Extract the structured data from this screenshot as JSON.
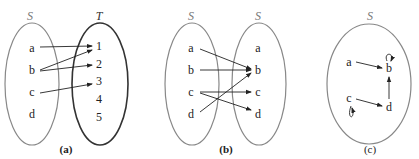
{
  "panels": [
    {
      "caption": "(a)",
      "domain": {
        "name": "S",
        "elements": [
          "a",
          "b",
          "c",
          "d"
        ]
      },
      "codomain": {
        "name": "T",
        "elements": [
          "1",
          "2",
          "3",
          "4",
          "5"
        ]
      },
      "arrows": [
        [
          "a",
          "1"
        ],
        [
          "b",
          "1"
        ],
        [
          "b",
          "2"
        ],
        [
          "c",
          "3"
        ]
      ]
    },
    {
      "caption": "(b)",
      "domain": {
        "name": "S",
        "elements": [
          "a",
          "b",
          "c",
          "d"
        ]
      },
      "codomain": {
        "name": "S",
        "elements": [
          "a",
          "b",
          "c",
          "d"
        ]
      },
      "arrows": [
        [
          "a",
          "b"
        ],
        [
          "b",
          "b"
        ],
        [
          "c",
          "c"
        ],
        [
          "c",
          "d"
        ],
        [
          "d",
          "b"
        ]
      ]
    },
    {
      "caption": "(c)",
      "set": {
        "name": "S",
        "elements": [
          "a",
          "b",
          "c",
          "d"
        ]
      },
      "arrows": [
        [
          "a",
          "b"
        ],
        [
          "b",
          "b"
        ],
        [
          "c",
          "d"
        ],
        [
          "c",
          "c"
        ],
        [
          "d",
          "b"
        ]
      ]
    }
  ],
  "colors": {
    "light_ellipse": "#888888",
    "dark_ellipse": "#333333",
    "arrow": "#222222"
  }
}
